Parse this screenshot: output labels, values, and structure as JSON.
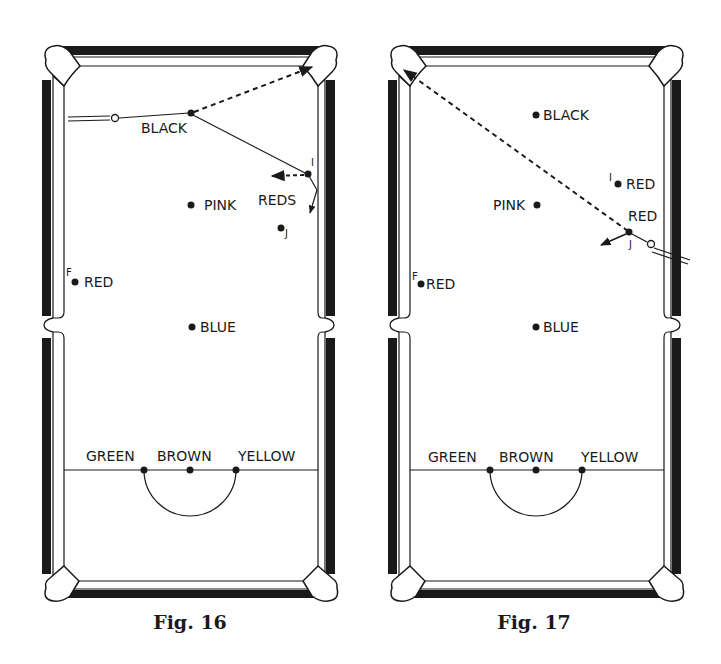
{
  "figures": [
    {
      "caption": "Fig. 16",
      "balls": {
        "black": "BLACK",
        "pink": "PINK",
        "blue": "BLUE",
        "red_f": "RED",
        "reds": "REDS",
        "green": "GREEN",
        "brown": "BROWN",
        "yellow": "YELLOW"
      },
      "markers": {
        "f": "F",
        "i": "I",
        "j": "J"
      }
    },
    {
      "caption": "Fig. 17",
      "balls": {
        "black": "BLACK",
        "pink": "PINK",
        "blue": "BLUE",
        "red_f": "RED",
        "red_i": "RED",
        "red_j": "RED",
        "green": "GREEN",
        "brown": "BROWN",
        "yellow": "YELLOW"
      },
      "markers": {
        "f": "F",
        "i": "I",
        "j": "J"
      }
    }
  ],
  "colors": {
    "ink": "#1a1a1a",
    "paper": "#ffffff"
  }
}
